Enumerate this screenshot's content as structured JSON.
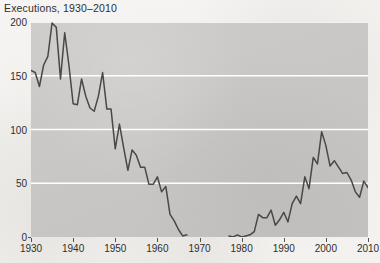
{
  "chart_data": {
    "type": "line",
    "title": "Executions, 1930–2010",
    "xlabel": "",
    "ylabel": "",
    "xlim": [
      1930,
      2010
    ],
    "ylim": [
      0,
      200
    ],
    "grid": true,
    "grid_orientation": "horizontal",
    "legend": false,
    "line_color": "#4a4845",
    "panel_color": "#c9c8c6",
    "gridline_color": "#ffffff",
    "xticks": [
      1930,
      1940,
      1950,
      1960,
      1970,
      1980,
      1990,
      2000,
      2010
    ],
    "xtick_labels": [
      "1930",
      "1940",
      "1950",
      "1960",
      "1970",
      "1980",
      "1990",
      "2000",
      "2010"
    ],
    "yticks": [
      0,
      50,
      100,
      150,
      200
    ],
    "ytick_labels": [
      "0",
      "50",
      "100",
      "150",
      "200"
    ],
    "series": [
      {
        "name": "Executions",
        "x": [
          1930,
          1931,
          1932,
          1933,
          1934,
          1935,
          1936,
          1937,
          1938,
          1939,
          1940,
          1941,
          1942,
          1943,
          1944,
          1945,
          1946,
          1947,
          1948,
          1949,
          1950,
          1951,
          1952,
          1953,
          1954,
          1955,
          1956,
          1957,
          1958,
          1959,
          1960,
          1961,
          1962,
          1963,
          1964,
          1965,
          1966,
          1967,
          1977,
          1978,
          1979,
          1980,
          1981,
          1982,
          1983,
          1984,
          1985,
          1986,
          1987,
          1988,
          1989,
          1990,
          1991,
          1992,
          1993,
          1994,
          1995,
          1996,
          1997,
          1998,
          1999,
          2000,
          2001,
          2002,
          2003,
          2004,
          2005,
          2006,
          2007,
          2008,
          2009,
          2010
        ],
        "values": [
          155,
          153,
          140,
          160,
          168,
          199,
          195,
          147,
          190,
          160,
          124,
          123,
          147,
          131,
          120,
          117,
          131,
          153,
          119,
          119,
          82,
          105,
          83,
          62,
          81,
          76,
          65,
          65,
          49,
          49,
          56,
          42,
          47,
          21,
          15,
          7,
          1,
          2,
          1,
          0,
          2,
          0,
          1,
          2,
          5,
          21,
          18,
          18,
          25,
          11,
          16,
          23,
          14,
          31,
          38,
          31,
          56,
          45,
          74,
          68,
          98,
          85,
          66,
          71,
          65,
          59,
          60,
          53,
          42,
          37,
          52,
          46
        ]
      }
    ]
  }
}
